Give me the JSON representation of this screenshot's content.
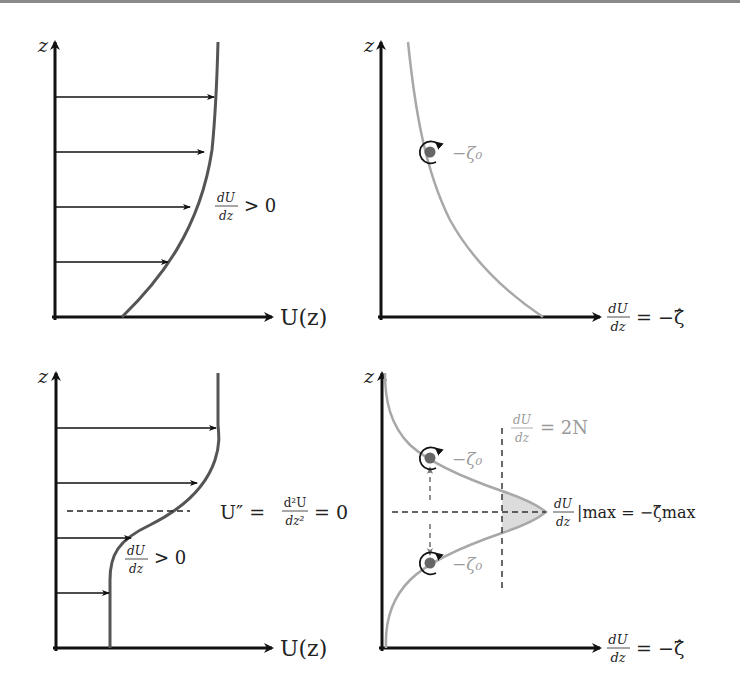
{
  "figure": {
    "panels": [
      {
        "id": "top-left",
        "axis_y_label": "z",
        "axis_x_label": "U(z)",
        "annotation": {
          "num": "dU",
          "den": "dz",
          "rest": "> 0"
        }
      },
      {
        "id": "top-right",
        "axis_y_label": "z",
        "axis_x_label": {
          "num": "dU",
          "den": "dz",
          "rest": "= −ζ̂"
        },
        "vortex_label": "−ζ₀"
      },
      {
        "id": "bottom-left",
        "axis_y_label": "z",
        "axis_x_label": "U(z)",
        "annotation": {
          "num": "dU",
          "den": "dz",
          "rest": "> 0"
        },
        "inflection_label": {
          "lhs": "U″ =",
          "num": "d²U",
          "den": "dz²",
          "rest": "= 0"
        }
      },
      {
        "id": "bottom-right",
        "axis_y_label": "z",
        "axis_x_label": {
          "num": "dU",
          "den": "dz",
          "rest": "= −ζ̂"
        },
        "threshold_label": {
          "num": "dU",
          "den": "dz",
          "rest": "= 2N"
        },
        "max_label": {
          "num": "dU",
          "den": "dz",
          "rest": "|max = −ζ̂max"
        },
        "vortex_label_upper": "−ζ₀",
        "vortex_label_lower": "−ζ₀"
      }
    ],
    "colors": {
      "axis": "#111111",
      "profile_curve": "#555555",
      "shear_curve": "#a8a8a8",
      "fill": "#dcdcdc",
      "dot": "#666666",
      "gray_text": "#9a9a9a"
    }
  }
}
